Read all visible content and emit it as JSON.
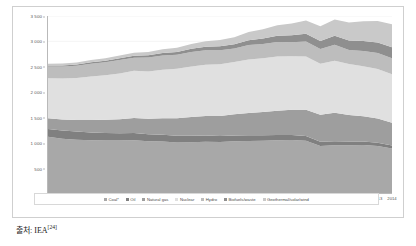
{
  "chart_data": {
    "type": "area",
    "stacked": true,
    "title": "",
    "subtitle": "",
    "xlabel": "",
    "ylabel": "",
    "ylim": [
      0,
      3500
    ],
    "ytick_step": 500,
    "grid": true,
    "legend_position": "bottom",
    "ytick_labels": [
      "0",
      "500",
      "1 000",
      "1 500",
      "2 000",
      "2 500",
      "3 000",
      "3 500"
    ],
    "ytick_values": [
      0,
      500,
      1000,
      1500,
      2000,
      2500,
      3000,
      3500
    ],
    "categories": [
      "1990",
      "1991",
      "1992",
      "1993",
      "1994",
      "1995",
      "1996",
      "1997",
      "1998",
      "1999",
      "2000",
      "2001",
      "2002",
      "2003",
      "2004",
      "2005",
      "2006",
      "2007",
      "2008",
      "2009",
      "2010",
      "2011",
      "2012",
      "2013",
      "2014"
    ],
    "series": [
      {
        "name": "Coal*",
        "color": "#a8a8a8",
        "values": [
          1110,
          1075,
          1055,
          1045,
          1040,
          1040,
          1045,
          1025,
          1020,
          1000,
          1005,
          1015,
          1010,
          1025,
          1030,
          1035,
          1045,
          1050,
          1035,
          930,
          945,
          945,
          950,
          930,
          880
        ]
      },
      {
        "name": "Oil",
        "color": "#808080",
        "values": [
          155,
          160,
          160,
          150,
          145,
          140,
          140,
          135,
          130,
          130,
          125,
          120,
          115,
          110,
          110,
          105,
          100,
          95,
          90,
          85,
          80,
          75,
          70,
          65,
          60
        ]
      },
      {
        "name": "Natural gas",
        "color": "#9e9e9e",
        "values": [
          215,
          220,
          230,
          250,
          265,
          280,
          300,
          310,
          330,
          350,
          375,
          390,
          400,
          420,
          440,
          460,
          480,
          500,
          520,
          530,
          560,
          520,
          500,
          480,
          450
        ]
      },
      {
        "name": "Nuclear",
        "color": "#e0e0e0",
        "values": [
          790,
          810,
          830,
          860,
          880,
          905,
          930,
          935,
          955,
          975,
          995,
          1010,
          1020,
          1035,
          1060,
          1065,
          1075,
          1060,
          1055,
          1010,
          1030,
          1010,
          985,
          975,
          960
        ]
      },
      {
        "name": "Hydro",
        "color": "#bdbdbd",
        "values": [
          230,
          235,
          240,
          250,
          255,
          265,
          260,
          275,
          285,
          280,
          290,
          290,
          280,
          265,
          285,
          280,
          285,
          275,
          295,
          290,
          315,
          280,
          305,
          320,
          315
        ]
      },
      {
        "name": "Biofuels/waste",
        "color": "#8f8f8f",
        "values": [
          20,
          22,
          25,
          28,
          32,
          36,
          40,
          44,
          50,
          55,
          62,
          68,
          76,
          84,
          95,
          108,
          122,
          138,
          152,
          162,
          178,
          188,
          198,
          208,
          215
        ]
      },
      {
        "name": "Geothermal/solar/wind",
        "color": "#c9c9c9",
        "values": [
          35,
          38,
          42,
          46,
          50,
          55,
          60,
          66,
          74,
          84,
          96,
          110,
          126,
          142,
          162,
          184,
          208,
          235,
          265,
          290,
          325,
          355,
          390,
          425,
          455
        ]
      }
    ]
  },
  "axis": {
    "y_ticks": [
      "3 500",
      "3 000",
      "2 500",
      "2 000",
      "1 500",
      "1 000",
      "500",
      "0"
    ],
    "x_ticks": [
      "1990",
      "1991",
      "1992",
      "1993",
      "1994",
      "1995",
      "1996",
      "1997",
      "1998",
      "1999",
      "2000",
      "2001",
      "2002",
      "2003",
      "2004",
      "2005",
      "2006",
      "2007",
      "2008",
      "2009",
      "2010",
      "2011",
      "2012",
      "2013",
      "2014"
    ]
  },
  "legend": {
    "items": [
      {
        "label": "Coal*",
        "color": "#a8a8a8"
      },
      {
        "label": "Oil",
        "color": "#808080"
      },
      {
        "label": "Natural gas",
        "color": "#9e9e9e"
      },
      {
        "label": "Nuclear",
        "color": "#e0e0e0"
      },
      {
        "label": "Hydro",
        "color": "#bdbdbd"
      },
      {
        "label": "Biofuels/waste",
        "color": "#8f8f8f"
      },
      {
        "label": "Geothermal/solar/wind",
        "color": "#c9c9c9"
      }
    ]
  },
  "source": {
    "prefix": "출처: IEA",
    "reference": "[24]"
  }
}
